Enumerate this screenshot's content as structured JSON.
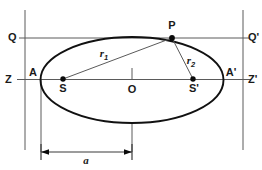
{
  "figure": {
    "type": "geometry-diagram",
    "width": 262,
    "height": 170,
    "background_color": "#ffffff"
  },
  "labels": {
    "directrix_left_top": "Q",
    "directrix_right_top": "Q'",
    "axis_left": "Z",
    "axis_right": "Z'",
    "vertex_left": "A",
    "vertex_right": "A'",
    "focus_left": "S",
    "focus_right": "S'",
    "center": "O",
    "point_on_ellipse": "P",
    "radius_1_base": "r",
    "radius_1_sub": "1",
    "radius_2_base": "r",
    "radius_2_sub": "2",
    "semi_major_axis": "a"
  },
  "geometry": {
    "ellipse": {
      "cx": 132,
      "cy": 80,
      "rx": 91.5,
      "ry": 43
    },
    "points": {
      "P": {
        "x": 172,
        "y": 38
      },
      "S": {
        "x": 63,
        "y": 79
      },
      "S_prime": {
        "x": 193,
        "y": 79
      },
      "O": {
        "x": 132,
        "y": 79
      },
      "A": {
        "x": 40.5,
        "y": 79
      },
      "A_prime": {
        "x": 223.5,
        "y": 79
      }
    },
    "lines": {
      "horizontal_axis_y": 79.5,
      "directrix_top_y": 38,
      "vertical_left_x": 25,
      "vertical_right_x": 243,
      "dimension_y": 152,
      "dimension_from_x": 41,
      "dimension_to_x": 132
    }
  },
  "colors": {
    "curve": "#111111",
    "axis": "#5a5a5a",
    "text": "#1a1a1a",
    "dot": "#0a0a0a",
    "dimension": "#3a3a3a"
  }
}
